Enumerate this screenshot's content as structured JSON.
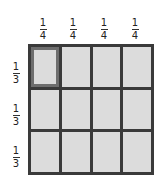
{
  "diagram": {
    "column_labels": [
      {
        "numerator": "1",
        "denominator": "4"
      },
      {
        "numerator": "1",
        "denominator": "4"
      },
      {
        "numerator": "1",
        "denominator": "4"
      },
      {
        "numerator": "1",
        "denominator": "4"
      }
    ],
    "row_labels": [
      {
        "numerator": "1",
        "denominator": "3"
      },
      {
        "numerator": "1",
        "denominator": "3"
      },
      {
        "numerator": "1",
        "denominator": "3"
      }
    ],
    "grid": {
      "rows": 3,
      "columns": 4,
      "highlighted_cell": {
        "row": 0,
        "col": 0
      }
    },
    "colors": {
      "cell_fill": "#dcdcdc",
      "grid_line": "#3a3a3a",
      "highlight_border": "#6e6e6e"
    }
  }
}
